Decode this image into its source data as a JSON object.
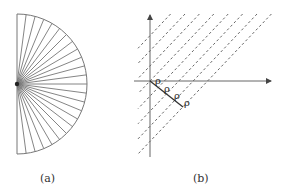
{
  "figure": {
    "panels": [
      {
        "id": "a",
        "caption": "(a)",
        "description": "Semicircle fan with radial spokes",
        "center": [
          17,
          84
        ],
        "radius": 70,
        "sectors": 24
      },
      {
        "id": "b",
        "caption": "(b)",
        "description": "Axes with parallel dashed lines spaced by rho",
        "label_symbol": "ρ",
        "labels": [
          "ρ",
          "ρ",
          "ρ",
          "ρ"
        ],
        "dashed_line_count": 8
      }
    ]
  },
  "colors": {
    "stroke": "#777777",
    "dark": "#222222"
  }
}
